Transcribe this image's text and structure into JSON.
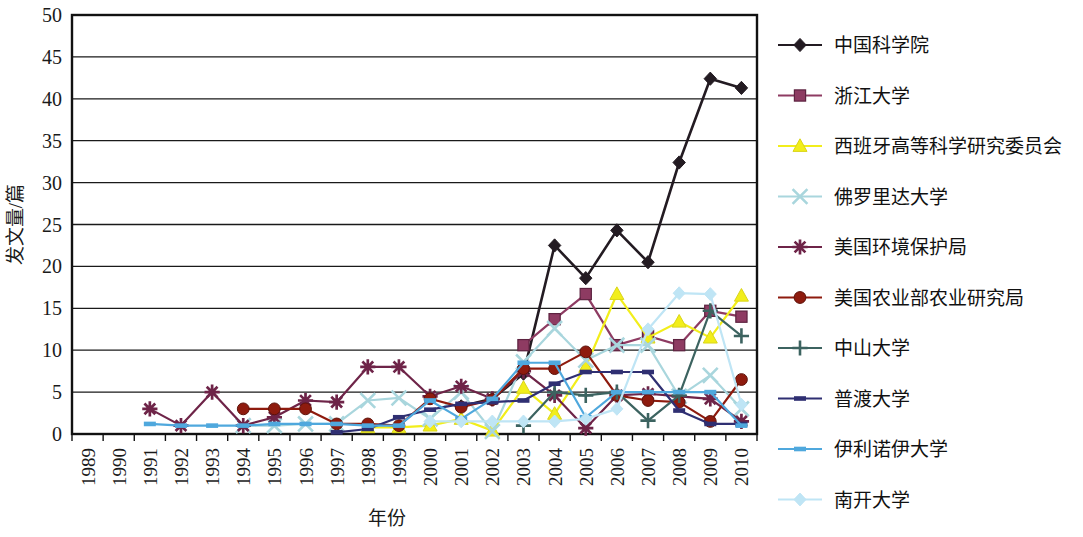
{
  "chart_data": {
    "type": "line",
    "title": "",
    "xlabel": "年份",
    "ylabel": "发文量/篇",
    "xlim": [
      1989,
      2010
    ],
    "ylim": [
      0,
      50
    ],
    "ytick_step": 5,
    "yticks": [
      0,
      5,
      10,
      15,
      20,
      25,
      30,
      35,
      40,
      45,
      50
    ],
    "grid": "horizontal",
    "legend_position": "right",
    "categories": [
      1989,
      1990,
      1991,
      1992,
      1993,
      1994,
      1995,
      1996,
      1997,
      1998,
      1999,
      2000,
      2001,
      2002,
      2003,
      2004,
      2005,
      2006,
      2007,
      2008,
      2009,
      2010
    ],
    "xtick_labels": [
      "1989",
      "1990",
      "1991",
      "1992",
      "1993",
      "1994",
      "1995",
      "1996",
      "1997",
      "1998",
      "1999",
      "2000",
      "2001",
      "2002",
      "2003",
      "2004",
      "2005",
      "2006",
      "2007",
      "2008",
      "2009",
      "2010"
    ],
    "series": [
      {
        "name": "中国科学院",
        "color": "#231b22",
        "marker": "diamond",
        "values": [
          null,
          null,
          null,
          null,
          null,
          null,
          null,
          null,
          null,
          null,
          null,
          null,
          3.3,
          4.2,
          7.2,
          22.5,
          18.6,
          24.3,
          20.5,
          32.4,
          42.4,
          41.3
        ]
      },
      {
        "name": "浙江大学",
        "color": "#8e3b62",
        "marker": "square",
        "values": [
          null,
          null,
          null,
          null,
          null,
          null,
          null,
          null,
          null,
          null,
          null,
          null,
          null,
          null,
          10.6,
          13.7,
          16.7,
          10.6,
          11.7,
          10.6,
          14.7,
          14.0
        ]
      },
      {
        "name": "西班牙高等科学研究委员会",
        "color": "#f2ee1b",
        "marker": "triangle",
        "values": [
          null,
          null,
          null,
          null,
          null,
          null,
          null,
          null,
          null,
          0.8,
          0.8,
          1.0,
          1.8,
          0.4,
          5.5,
          2.4,
          8.0,
          16.7,
          11.5,
          13.4,
          11.5,
          16.5
        ]
      },
      {
        "name": "佛罗里达大学",
        "color": "#a9d6dd",
        "marker": "cross-x",
        "values": [
          null,
          null,
          null,
          null,
          null,
          1.0,
          1.0,
          1.2,
          1.2,
          4.0,
          4.3,
          1.8,
          5.0,
          0.3,
          8.6,
          12.6,
          8.8,
          10.6,
          10.6,
          4.5,
          7.0,
          3.0
        ]
      },
      {
        "name": "美国环境保护局",
        "color": "#6e2448",
        "marker": "asterisk",
        "values": [
          null,
          null,
          3.0,
          1.0,
          5.0,
          1.0,
          2.0,
          4.0,
          3.8,
          8.0,
          8.0,
          4.5,
          5.7,
          4.2,
          7.5,
          4.6,
          0.7,
          4.6,
          4.8,
          4.5,
          4.2,
          1.5
        ]
      },
      {
        "name": "美国农业部农业研究局",
        "color": "#8e1b0e",
        "marker": "circle",
        "values": [
          null,
          null,
          null,
          null,
          null,
          3.0,
          3.0,
          3.0,
          1.2,
          1.2,
          1.0,
          4.2,
          3.2,
          4.1,
          7.8,
          7.8,
          9.8,
          4.6,
          4.0,
          3.8,
          1.5,
          6.5
        ]
      },
      {
        "name": "中山大学",
        "color": "#3c6360",
        "marker": "plus",
        "values": [
          null,
          null,
          null,
          null,
          null,
          null,
          null,
          null,
          null,
          null,
          null,
          null,
          null,
          null,
          1.0,
          5.0,
          4.6,
          5.0,
          1.6,
          4.6,
          14.7,
          11.7
        ]
      },
      {
        "name": "普渡大学",
        "color": "#2f2f72",
        "marker": "dash",
        "values": [
          null,
          null,
          null,
          null,
          null,
          null,
          null,
          null,
          0.2,
          0.6,
          2.0,
          2.9,
          3.6,
          3.8,
          4.0,
          6.0,
          7.4,
          7.4,
          7.4,
          2.8,
          1.2,
          1.2
        ]
      },
      {
        "name": "伊利诺伊大学",
        "color": "#4fa8dd",
        "marker": "dash",
        "values": [
          null,
          null,
          1.2,
          1.0,
          1.0,
          1.0,
          1.2,
          1.2,
          1.2,
          1.0,
          1.0,
          4.0,
          1.8,
          4.2,
          8.5,
          8.5,
          2.0,
          5.0,
          5.0,
          5.0,
          5.0,
          1.0
        ]
      },
      {
        "name": "南开大学",
        "color": "#bfe5f5",
        "marker": "diamond-small",
        "values": [
          null,
          null,
          null,
          null,
          null,
          null,
          null,
          null,
          null,
          null,
          null,
          1.5,
          1.5,
          1.5,
          1.5,
          1.5,
          1.8,
          3.0,
          12.5,
          16.8,
          16.7,
          3.5
        ]
      }
    ]
  },
  "legend": {
    "items": [
      {
        "label": "中国科学院"
      },
      {
        "label": "浙江大学"
      },
      {
        "label": "西班牙高等科学研究委员会"
      },
      {
        "label": "佛罗里达大学"
      },
      {
        "label": "美国环境保护局"
      },
      {
        "label": "美国农业部农业研究局"
      },
      {
        "label": "中山大学"
      },
      {
        "label": "普渡大学"
      },
      {
        "label": "伊利诺伊大学"
      },
      {
        "label": "南开大学"
      }
    ]
  },
  "axes": {
    "y_title": "发文量/篇",
    "x_title": "年份"
  }
}
